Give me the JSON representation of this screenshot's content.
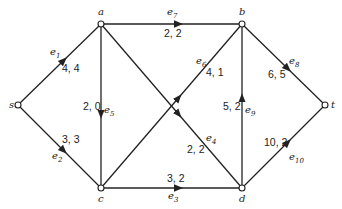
{
  "diagram": {
    "type": "flow-network",
    "nodes": [
      {
        "id": "s",
        "label": "s",
        "x": 18,
        "y": 105,
        "lx": 9,
        "ly": 108
      },
      {
        "id": "a",
        "label": "a",
        "x": 101,
        "y": 24,
        "lx": 98,
        "ly": 15
      },
      {
        "id": "b",
        "label": "b",
        "x": 242,
        "y": 24,
        "lx": 239,
        "ly": 15
      },
      {
        "id": "c",
        "label": "c",
        "x": 101,
        "y": 188,
        "lx": 98,
        "ly": 202
      },
      {
        "id": "d",
        "label": "d",
        "x": 242,
        "y": 188,
        "lx": 239,
        "ly": 202
      },
      {
        "id": "t",
        "label": "t",
        "x": 325,
        "y": 105,
        "lx": 331,
        "ly": 108
      }
    ],
    "edges": [
      {
        "id": "e1",
        "name": "e",
        "sub": "1",
        "from": "s",
        "to": "a",
        "capacity": 4,
        "flow": 4,
        "text": "4, 4",
        "nx": 50,
        "ny": 55,
        "fx": 62,
        "fy": 72
      },
      {
        "id": "e2",
        "name": "e",
        "sub": "2",
        "from": "s",
        "to": "c",
        "capacity": 3,
        "flow": 3,
        "text": "3, 3",
        "nx": 52,
        "ny": 159,
        "fx": 62,
        "fy": 143
      },
      {
        "id": "e3",
        "name": "e",
        "sub": "3",
        "from": "c",
        "to": "d",
        "capacity": 3,
        "flow": 2,
        "text": "3, 2",
        "nx": 168,
        "ny": 199,
        "fx": 167,
        "fy": 182
      },
      {
        "id": "e4",
        "name": "e",
        "sub": "4",
        "from": "a",
        "to": "d",
        "capacity": 2,
        "flow": 2,
        "text": "2, 2",
        "nx": 206,
        "ny": 141,
        "fx": 187,
        "fy": 153
      },
      {
        "id": "e5",
        "name": "e",
        "sub": "5",
        "from": "a",
        "to": "c",
        "capacity": 2,
        "flow": 0,
        "text": "2, 0",
        "nx": 104,
        "ny": 113,
        "fx": 83,
        "fy": 110
      },
      {
        "id": "e6",
        "name": "e",
        "sub": "6",
        "from": "c",
        "to": "b",
        "capacity": 4,
        "flow": 1,
        "text": "4, 1",
        "nx": 196,
        "ny": 64,
        "fx": 206,
        "fy": 76
      },
      {
        "id": "e7",
        "name": "e",
        "sub": "7",
        "from": "a",
        "to": "b",
        "capacity": 2,
        "flow": 2,
        "text": "2, 2",
        "nx": 167,
        "ny": 15,
        "fx": 164,
        "fy": 37
      },
      {
        "id": "e8",
        "name": "e",
        "sub": "8",
        "from": "b",
        "to": "t",
        "capacity": 6,
        "flow": 5,
        "text": "6, 5",
        "nx": 289,
        "ny": 64,
        "fx": 268,
        "fy": 78
      },
      {
        "id": "e9",
        "name": "e",
        "sub": "9",
        "from": "d",
        "to": "b",
        "capacity": 5,
        "flow": 2,
        "text": "5, 2",
        "nx": 245,
        "ny": 113,
        "fx": 223,
        "fy": 110
      },
      {
        "id": "e10",
        "name": "e",
        "sub": "10",
        "from": "d",
        "to": "t",
        "capacity": 10,
        "flow": 2,
        "text": "10, 2",
        "nx": 289,
        "ny": 160,
        "fx": 264,
        "fy": 146
      }
    ],
    "colors": {
      "stroke": "#222222",
      "background": "#ffffff"
    }
  }
}
